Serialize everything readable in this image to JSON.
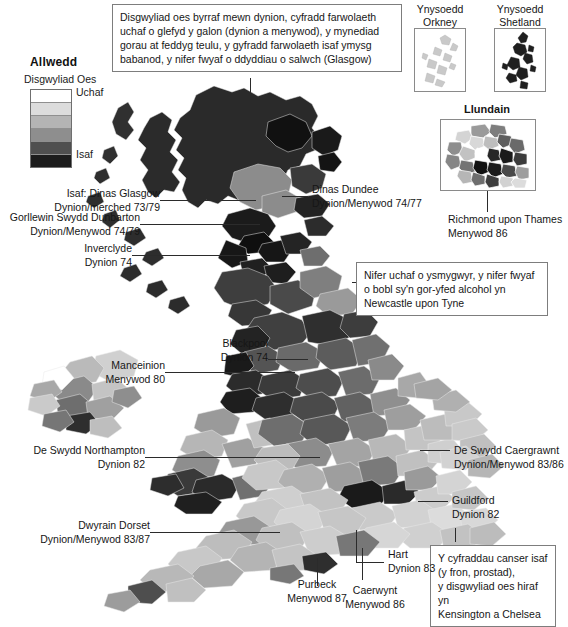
{
  "legend": {
    "title": "Allwedd",
    "subtitle": "Disgwyliad Oes",
    "high_label": "Uchaf",
    "low_label": "Isaf",
    "swatches": [
      "#ffffff",
      "#dcdcdc",
      "#b4b4b4",
      "#8e8e8e",
      "#4f4f4f",
      "#1c1c1c"
    ]
  },
  "callouts": {
    "glasgow_box": "Disgwyliad oes byrraf mewn dynion, cyfradd farwolaeth uchaf o glefyd y galon (dynion a menywod), y mynediad gorau at feddyg teulu, y gyfradd farwolaeth isaf ymysg babanod, y nifer fwyaf o ddyddiau o salwch (Glasgow)",
    "newcastle_box": "Nifer uchaf o ysmygwyr, y nifer fwyaf o bobl sy'n gor-yfed alcohol yn Newcastle upon Tyne",
    "kensington_box": "Y cyfraddau canser isaf\n(y fron, prostad),\ny disgwyliad oes hiraf yn\nKensington a Chelsea"
  },
  "insets": {
    "orkney_caption": "Ynysoedd\nOrkney",
    "shetland_caption": "Ynysoedd\nShetland",
    "london_caption": "Llundain"
  },
  "labels": {
    "glasgow": "Isaf: Dinas Glasgow\nDynion/merched 73/79",
    "dunbarton": "Gorllewin Swydd Dunbarton\nDynion/Menywod 74/79",
    "inverclyde": "Inverclyde\nDynion 74",
    "dundee": "Dinas Dundee\nDynion/Menywod 74/77",
    "richmond": "Richmond upon Thames\nMenywod 86",
    "blackpool": "Blackpool\nDynion 74",
    "manchester": "Manceinion\nMenywod 80",
    "northampton": "De Swydd Northampton\nDynion 82",
    "cambridge": "De Swydd Caergrawnt\nDynion/Menywod 83/86",
    "dorset": "Dwyrain Dorset\nDynion/Menywod 83/87",
    "guildford": "Guildford\nDynion 82",
    "hart": "Hart\nDynion 83",
    "purbeck": "Purbeck\nMenywod 87",
    "winchester": "Caerwynt\nMenywod 86"
  }
}
